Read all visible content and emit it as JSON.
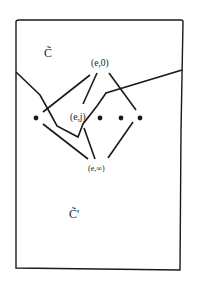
{
  "diagram": {
    "region_labels": {
      "upper": "C̃",
      "lower": "C̃'"
    },
    "nodes": {
      "top": "(e,0)",
      "middle": "(e,j)",
      "bottom": "(e,∞)"
    },
    "dots_count": 5,
    "colors": {
      "line": "#1a1a1a",
      "background": "#ffffff"
    }
  }
}
